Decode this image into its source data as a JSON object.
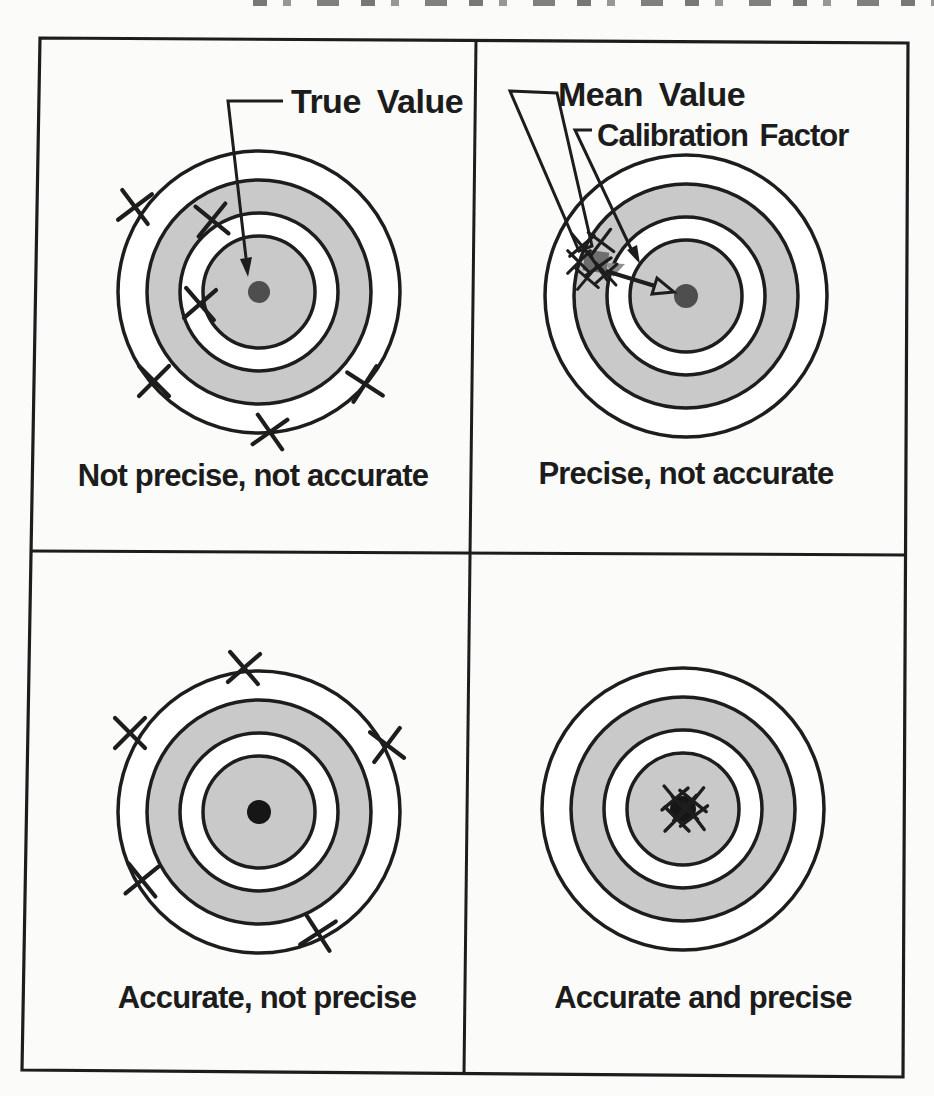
{
  "figure_type": "accuracy-vs-precision-target-diagram",
  "colors": {
    "ink": "#1d1d1d",
    "ring_gray": "#c9c9c9",
    "ring_white": "#ffffff",
    "paper": "#fbfbf9",
    "dot_dark_gray": "#4e4e4e",
    "dot_black": "#161616",
    "mean_square_gray": "#6e6e6e",
    "mean_triangle_gray": "#8f8f8f"
  },
  "target_spec": {
    "radii": [
      141,
      112,
      79,
      56
    ],
    "ring_fills": [
      "#ffffff",
      "#c9c9c9",
      "#ffffff",
      "#c9c9c9"
    ],
    "ring_stroke_width": 3.5
  },
  "annotations": {
    "true_value": {
      "label": "True Value"
    },
    "mean_value": {
      "label": "Mean Value"
    },
    "calibration_factor": {
      "label": "Calibration Factor"
    }
  },
  "quadrants": [
    {
      "name": "top-left",
      "caption": "Not precise, not accurate",
      "center": {
        "x": 259,
        "y": 292
      },
      "dot": {
        "r": 11,
        "color": "#4e4e4e"
      },
      "x_marks": [
        {
          "x": 135,
          "y": 207,
          "r": 8
        },
        {
          "x": 212,
          "y": 220,
          "r": -6
        },
        {
          "x": 200,
          "y": 304,
          "r": 4
        },
        {
          "x": 154,
          "y": 381,
          "r": 0
        },
        {
          "x": 270,
          "y": 432,
          "r": 10
        },
        {
          "x": 365,
          "y": 384,
          "r": -12
        }
      ]
    },
    {
      "name": "top-right",
      "caption": "Precise, not accurate",
      "center": {
        "x": 686,
        "y": 296
      },
      "dot": {
        "r": 12,
        "color": "#4e4e4e"
      },
      "x_marks": [
        {
          "x": 582,
          "y": 246,
          "s": 0.75,
          "r": 5
        },
        {
          "x": 601,
          "y": 242,
          "s": 0.75,
          "r": -8
        },
        {
          "x": 579,
          "y": 262,
          "s": 0.75,
          "r": 0
        },
        {
          "x": 598,
          "y": 267,
          "s": 0.75,
          "r": 10
        },
        {
          "x": 587,
          "y": 278,
          "s": 0.7,
          "r": -5
        },
        {
          "x": 606,
          "y": 274,
          "s": 0.7,
          "r": 3
        }
      ]
    },
    {
      "name": "bottom-left",
      "caption": "Accurate, not precise",
      "center": {
        "x": 259,
        "y": 812
      },
      "dot": {
        "r": 12,
        "color": "#161616"
      },
      "x_marks": [
        {
          "x": 244,
          "y": 668,
          "r": 4
        },
        {
          "x": 130,
          "y": 733,
          "r": 0
        },
        {
          "x": 387,
          "y": 745,
          "r": -8
        },
        {
          "x": 142,
          "y": 880,
          "r": 6
        },
        {
          "x": 318,
          "y": 933,
          "r": 12
        }
      ]
    },
    {
      "name": "bottom-right",
      "caption": "Accurate and precise",
      "center": {
        "x": 683,
        "y": 809
      },
      "dot": {
        "r": 13,
        "color": "#161616"
      },
      "x_marks": [
        {
          "x": 675,
          "y": 799,
          "s": 0.8,
          "r": 5
        },
        {
          "x": 693,
          "y": 801,
          "s": 0.8,
          "r": -6
        },
        {
          "x": 677,
          "y": 819,
          "s": 0.8,
          "r": 0
        },
        {
          "x": 694,
          "y": 816,
          "s": 0.8,
          "r": 8
        },
        {
          "x": 685,
          "y": 808,
          "s": 0.8,
          "r": -3
        }
      ]
    }
  ]
}
